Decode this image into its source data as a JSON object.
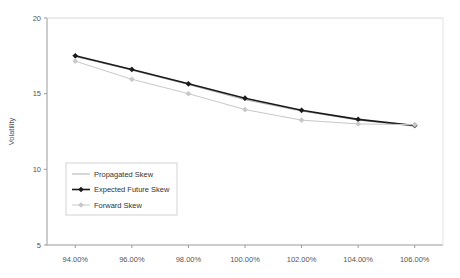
{
  "chart_data": {
    "type": "line",
    "title": "",
    "xlabel": "",
    "ylabel": "Volatility",
    "xlim": [
      93.0,
      107.0
    ],
    "ylim": [
      5,
      20
    ],
    "grid": false,
    "legend_position": "inside-lower-left",
    "categories": [
      "94.00%",
      "96.00%",
      "98.00%",
      "100.00%",
      "102.00%",
      "104.00%",
      "106.00%"
    ],
    "x": [
      94,
      96,
      98,
      100,
      102,
      104,
      106
    ],
    "xticks": [
      "94.00%",
      "96.00%",
      "98.00%",
      "100.00%",
      "102.00%",
      "104.00%",
      "106.00%"
    ],
    "yticks": [
      "5",
      "10",
      "15",
      "20"
    ],
    "ytick_values": [
      5,
      10,
      15,
      20
    ],
    "series": [
      {
        "name": "Propagated Skew",
        "color": "#a6a6a6",
        "marker": "none",
        "width": 0.9,
        "values": [
          17.45,
          16.55,
          15.6,
          14.6,
          13.85,
          13.25,
          12.85
        ]
      },
      {
        "name": "Expected Future Skew",
        "color": "#1a1a1a",
        "marker": "diamond",
        "width": 1.6,
        "values": [
          17.5,
          16.6,
          15.65,
          14.7,
          13.9,
          13.3,
          12.9
        ]
      },
      {
        "name": "Forward Skew",
        "color": "#c8c8c8",
        "marker": "diamond",
        "width": 1.0,
        "values": [
          17.15,
          15.95,
          15.0,
          13.95,
          13.25,
          13.0,
          12.95
        ]
      }
    ]
  },
  "legend": {
    "items": [
      {
        "label": "Propagated Skew"
      },
      {
        "label": "Expected Future Skew"
      },
      {
        "label": "Forward Skew"
      }
    ]
  }
}
